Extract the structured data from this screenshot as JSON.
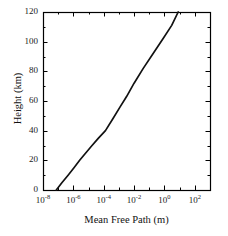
{
  "figure": {
    "background_color": "#ffffff",
    "line_color": "#111111",
    "axis_color": "#000000"
  },
  "axes": {
    "frame": {
      "left": 43,
      "right": 210,
      "top": 12,
      "bottom": 190
    }
  },
  "chart_data": {
    "type": "line",
    "title": "",
    "subtitle": "",
    "xlabel": "Mean Free Path (m)",
    "ylabel": "Height (km)",
    "xscale": "log",
    "yscale": "linear",
    "xlim": [
      1e-08,
      1000.0
    ],
    "ylim": [
      0,
      120
    ],
    "grid": false,
    "legend": null,
    "xticks": [
      1e-08,
      1e-06,
      0.0001,
      0.01,
      1,
      100
    ],
    "xtick_labels": [
      "10-8",
      "10-6",
      "10-4",
      "10-2",
      "10 0",
      "10 2"
    ],
    "xtick_mantissas": [
      "10",
      "10",
      "10",
      "10",
      "10",
      "10"
    ],
    "xtick_exponents": [
      "-8",
      "-6",
      "-4",
      "-2",
      "0",
      "2"
    ],
    "yticks": [
      0,
      20,
      40,
      60,
      80,
      100,
      120
    ],
    "ytick_labels": [
      "0",
      "20",
      "40",
      "60",
      "80",
      "100",
      "120"
    ],
    "xminor_ticks": [
      1e-07,
      1e-05,
      0.001,
      0.1,
      10,
      1000
    ],
    "series": [
      {
        "name": "Mean free path vs height",
        "x": [
          7.5e-08,
          1.8e-07,
          4.5e-07,
          1.1e-06,
          2.6e-06,
          6.5e-06,
          1.7e-05,
          4.5e-05,
          0.00013,
          0.0004,
          0.0012,
          0.0032,
          0.01,
          0.04,
          0.18,
          0.8,
          3.0,
          8.0
        ],
        "y": [
          0,
          5,
          10,
          15,
          20,
          25,
          30,
          35,
          40,
          48,
          56,
          63,
          72,
          82,
          92,
          102,
          111,
          120
        ]
      }
    ],
    "annotations": []
  }
}
